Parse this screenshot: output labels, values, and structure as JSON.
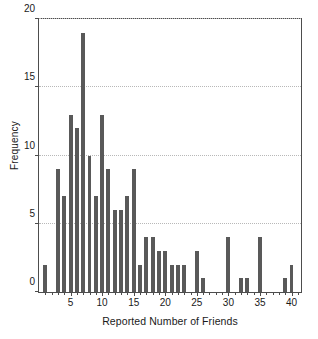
{
  "chart_data": {
    "type": "bar",
    "title": "",
    "subtitle": "",
    "xlabel": "Reported Number of Friends",
    "ylabel": "Frequency",
    "xlim": [
      0,
      41.5
    ],
    "ylim": [
      0,
      20
    ],
    "xticks": [
      5,
      10,
      15,
      20,
      25,
      30,
      35,
      40
    ],
    "yticks": [
      0,
      5,
      10,
      15,
      20
    ],
    "grid": "horizontal-dotted",
    "legend": "none",
    "bar_color": "#595959",
    "axis_color": "#4d4d4d",
    "grid_color": "#b8b8b8",
    "background": "#ffffff",
    "categories": [
      1,
      2,
      3,
      4,
      5,
      6,
      7,
      8,
      9,
      10,
      11,
      12,
      13,
      14,
      15,
      16,
      17,
      18,
      19,
      20,
      21,
      22,
      23,
      24,
      25,
      26,
      27,
      28,
      29,
      30,
      31,
      32,
      33,
      34,
      35,
      36,
      37,
      38,
      39,
      40,
      41
    ],
    "values": [
      2,
      0,
      9,
      7,
      13,
      12,
      19,
      10,
      7,
      13,
      9,
      6,
      6,
      7,
      9,
      2,
      4,
      4,
      3,
      3,
      2,
      2,
      2,
      0,
      3,
      1,
      0,
      0,
      0,
      4,
      0,
      1,
      1,
      0,
      4,
      0,
      0,
      0,
      1,
      2,
      0
    ]
  }
}
